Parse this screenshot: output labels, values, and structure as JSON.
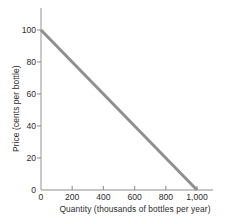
{
  "chart_data": {
    "type": "line",
    "title": "",
    "subtitle": "",
    "xlabel": "Quantity (thousands of bottles per year)",
    "ylabel": "Price (cents per bottle)",
    "xlim": [
      0,
      1000
    ],
    "ylim": [
      0,
      100
    ],
    "grid": false,
    "legend": "none",
    "xticks": [
      0,
      200,
      400,
      600,
      800,
      1000
    ],
    "xtick_labels": [
      "0",
      "200",
      "400",
      "600",
      "800",
      "1,000"
    ],
    "yticks": [
      0,
      20,
      40,
      60,
      80,
      100
    ],
    "ytick_labels": [
      "0",
      "20",
      "40",
      "60",
      "80",
      "100"
    ],
    "series": [
      {
        "name": "Demand",
        "color": "#8f8f8f",
        "x": [
          0,
          1000
        ],
        "values": [
          100,
          0
        ]
      }
    ],
    "annotations": []
  },
  "axis": {
    "line_color": "#b3b3b3",
    "tick_color": "#9a9a9a",
    "text_color": "#2b2b2b"
  }
}
